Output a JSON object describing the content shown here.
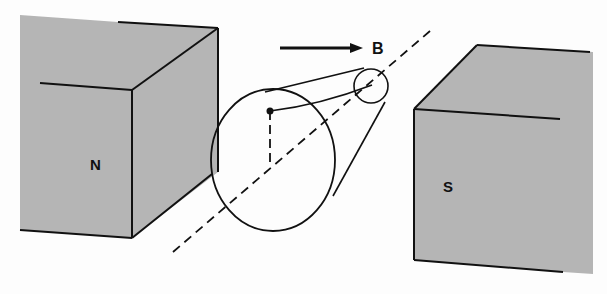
{
  "diagram": {
    "labels": {
      "north_pole": "N",
      "south_pole": "S",
      "field": "B"
    },
    "colors": {
      "magnet_fill": "#b5b5b5",
      "line": "#111111",
      "background": "#fdfdfd"
    }
  }
}
